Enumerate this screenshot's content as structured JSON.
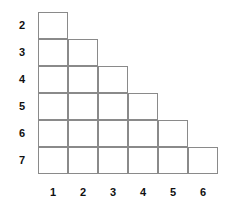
{
  "figure": {
    "type": "staircase-grid-diagram",
    "background_color": "#ffffff",
    "line_color": "#8a8a8a",
    "label_color": "#111111",
    "row_labels": [
      "2",
      "3",
      "4",
      "5",
      "6",
      "7"
    ],
    "column_labels": [
      "1",
      "2",
      "3",
      "4",
      "5",
      "6"
    ]
  },
  "chart_data": {
    "type": "table",
    "title": "",
    "xlabel": "",
    "ylabel": "",
    "categories": [
      "1",
      "2",
      "3",
      "4",
      "5",
      "6"
    ],
    "row_categories": [
      "2",
      "3",
      "4",
      "5",
      "6",
      "7"
    ],
    "column_heights": [
      6,
      5,
      4,
      3,
      2,
      1
    ],
    "row_widths": [
      1,
      2,
      3,
      4,
      5,
      6
    ],
    "total_cells": 21,
    "grid": true,
    "legend": "none"
  },
  "geometry": {
    "origin_x": 38,
    "origin_y": 12,
    "cell_width": 30,
    "cell_height": 27,
    "columns": 6,
    "rows": 6
  }
}
